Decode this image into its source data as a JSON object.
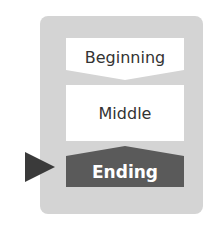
{
  "diagram": {
    "type": "story-structure",
    "sections": [
      {
        "label": "Beginning",
        "fill": "#ffffff",
        "text_color": "#333333",
        "shape": "chevron-down-bottom"
      },
      {
        "label": "Middle",
        "fill": "#ffffff",
        "text_color": "#333333",
        "shape": "rectangle"
      },
      {
        "label": "Ending",
        "fill": "#5a5a5a",
        "text_color": "#ffffff",
        "shape": "pointed-top",
        "highlighted": true
      }
    ],
    "pointer": {
      "target": "Ending",
      "color": "#3a3a3a",
      "icon": "triangle-right-icon"
    },
    "container_color": "#d4d4d4"
  }
}
